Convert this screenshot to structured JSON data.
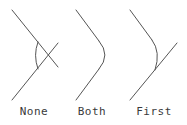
{
  "diagram": {
    "stroke_color": "#555555",
    "panels": [
      {
        "label": "None",
        "description": "Arc added, both original lines kept untrimmed and crossing"
      },
      {
        "label": "Both",
        "description": "Arc added, both lines trimmed to the arc"
      },
      {
        "label": "First",
        "description": "Arc added, only first line trimmed; second line extends past"
      }
    ]
  }
}
